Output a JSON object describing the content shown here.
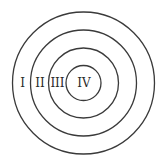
{
  "diagram": {
    "type": "concentric-circles",
    "center": [
      83.5,
      83
    ],
    "stroke_color": "#3a3a3a",
    "background": "#ffffff",
    "rings": [
      {
        "name": "ring-1",
        "radius": 71
      },
      {
        "name": "ring-2",
        "radius": 53
      },
      {
        "name": "ring-3",
        "radius": 35
      },
      {
        "name": "ring-4",
        "radius": 17.5
      }
    ],
    "labels": [
      {
        "text": "I",
        "x": 22.5,
        "y": 83
      },
      {
        "text": "II",
        "x": 40,
        "y": 83
      },
      {
        "text": "III",
        "x": 57.5,
        "y": 83
      },
      {
        "text": "IV",
        "x": 84,
        "y": 83
      }
    ]
  }
}
